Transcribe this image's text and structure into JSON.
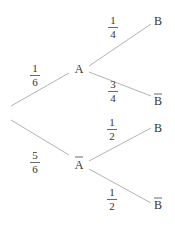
{
  "diagram": {
    "type": "probability-tree",
    "colors": {
      "line": "#b4b4b4",
      "text": "#333333",
      "background": "#ffffff"
    },
    "nodes": {
      "a": "A",
      "a_bar": "A",
      "b_given_a": "B",
      "bbar_given_a": "B",
      "b_given_abar": "B",
      "bbar_given_abar": "B"
    },
    "node_overlines": {
      "a": false,
      "a_bar": true,
      "b_given_a": false,
      "bbar_given_a": true,
      "b_given_abar": false,
      "bbar_given_abar": true
    },
    "edges": {
      "root_to_a": {
        "num": "1",
        "den": "6"
      },
      "root_to_abar": {
        "num": "5",
        "den": "6"
      },
      "a_to_b": {
        "num": "1",
        "den": "4"
      },
      "a_to_bbar": {
        "num": "3",
        "den": "4"
      },
      "abar_to_b": {
        "num": "1",
        "den": "2"
      },
      "abar_to_bbar": {
        "num": "1",
        "den": "2"
      }
    }
  }
}
